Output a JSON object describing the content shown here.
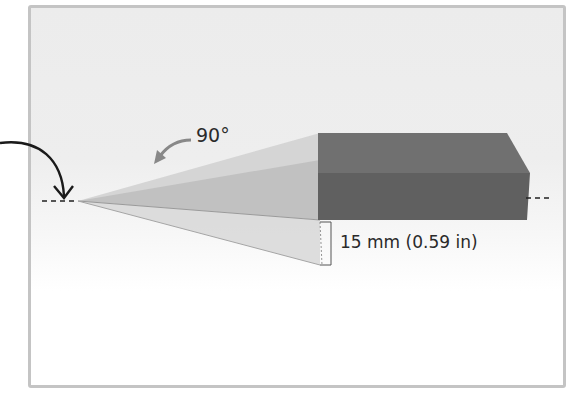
{
  "diagram": {
    "angle_label": "90°",
    "dimension_label": "15 mm (0.59 in)",
    "colors": {
      "frame_border": "#c4c4c4",
      "background_top": "#ececec",
      "block_top_face": "#6f6f6f",
      "block_front_face": "#5f5f5f",
      "wedge_light": "#cfcfcf",
      "wedge_mid": "#b9b9b9",
      "wedge_lower": "#d3d3d3",
      "arrow_black": "#1a1a1a",
      "arrow_gray": "#888888"
    },
    "elements": [
      "curved-pointer-arrow",
      "rotation-arrow",
      "wedge-sweep",
      "rectangular-block",
      "dashed-axis-line",
      "dimension-bracket"
    ]
  }
}
